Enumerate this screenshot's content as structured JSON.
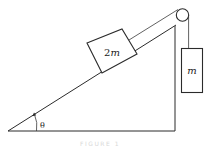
{
  "diagram": {
    "type": "physics-incline-pulley",
    "incline_block_label": "2m",
    "incline_block_label_parts": {
      "coef": "2",
      "var": "m"
    },
    "hanging_block_label": "m",
    "angle_label": "θ",
    "caption": "FIGURE 1"
  }
}
